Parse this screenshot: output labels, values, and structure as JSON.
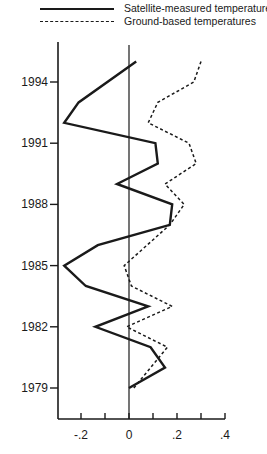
{
  "chart_data": {
    "type": "line",
    "orientation": "vertical-time",
    "title": "",
    "xlabel": "",
    "ylabel": "",
    "xlim": [
      -0.3,
      0.4
    ],
    "ylim": [
      1978,
      1995.5
    ],
    "x_ticks": [
      -0.3,
      -0.2,
      -0.1,
      0,
      0.1,
      0.2,
      0.3,
      0.4
    ],
    "x_tick_labels": [
      "-.2",
      "0",
      ".2",
      ".4"
    ],
    "x_tick_label_values": [
      -0.2,
      0,
      0.2,
      0.4
    ],
    "y_ticks": [
      1979,
      1982,
      1985,
      1988,
      1991,
      1994
    ],
    "y_tick_labels": [
      "1979",
      "1982",
      "1985",
      "1988",
      "1991",
      "1994"
    ],
    "grid": false,
    "reference_line_x": 0,
    "legend_position": "top",
    "series": [
      {
        "name": "Satellite-measured temperatures",
        "style": "solid",
        "years": [
          1979,
          1980,
          1981,
          1982,
          1983,
          1984,
          1985,
          1986,
          1987,
          1988,
          1989,
          1990,
          1991,
          1992,
          1993,
          1995
        ],
        "values": [
          0.0,
          0.15,
          0.09,
          -0.14,
          0.08,
          -0.18,
          -0.27,
          -0.13,
          0.17,
          0.18,
          -0.05,
          0.12,
          0.11,
          -0.27,
          -0.21,
          0.03
        ]
      },
      {
        "name": "Ground-based temperatures",
        "style": "dashed",
        "years": [
          1979,
          1981,
          1982,
          1983,
          1984,
          1985,
          1987,
          1988,
          1989,
          1990,
          1991,
          1992,
          1993,
          1994,
          1995
        ],
        "values": [
          0.02,
          0.16,
          -0.01,
          0.18,
          0.01,
          -0.02,
          0.17,
          0.23,
          0.15,
          0.28,
          0.25,
          0.08,
          0.12,
          0.27,
          0.3
        ]
      }
    ]
  },
  "legend": {
    "items": [
      {
        "label": "Satellite-measured temperatures",
        "style": "solid"
      },
      {
        "label": "Ground-based temperatures",
        "style": "dashed"
      }
    ]
  }
}
